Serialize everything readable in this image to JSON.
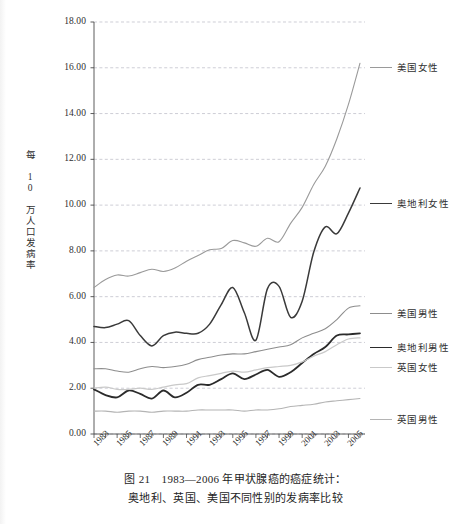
{
  "folio": "",
  "caption": {
    "line1": "图 21　1983—2006 年甲状腺癌的癌症统计：",
    "line2": "奥地利、英国、美国不同性别的发病率比较"
  },
  "axis": {
    "y_title": "每 10 万人口发病率"
  },
  "legend": [
    {
      "label": "美国女性",
      "color": "#9a9a9a",
      "width": 1.1,
      "y": 60
    },
    {
      "label": "奥地利女性",
      "color": "#3a3a3a",
      "width": 1.5,
      "y": 196
    },
    {
      "label": "美国男性",
      "color": "#8d8d8d",
      "width": 1.1,
      "y": 306
    },
    {
      "label": "奥地利男性",
      "color": "#2b2b2b",
      "width": 1.8,
      "y": 340
    },
    {
      "label": "英国女性",
      "color": "#c9c9c9",
      "width": 1.2,
      "y": 360
    },
    {
      "label": "英国男性",
      "color": "#b4b4b4",
      "width": 1.1,
      "y": 412
    }
  ],
  "chart_data": {
    "type": "line",
    "xlabel": "",
    "ylabel": "每 10 万人口发病率",
    "ylim": [
      0,
      18
    ],
    "yticks": [
      "0.00",
      "2.00",
      "4.00",
      "6.00",
      "8.00",
      "10.00",
      "12.00",
      "14.00",
      "16.00",
      "18.00"
    ],
    "ytick_values": [
      0,
      2,
      4,
      6,
      8,
      10,
      12,
      14,
      16,
      18
    ],
    "grid": true,
    "legend_position": "right",
    "x": [
      1983,
      1984,
      1985,
      1986,
      1987,
      1988,
      1989,
      1990,
      1991,
      1992,
      1993,
      1994,
      1995,
      1996,
      1997,
      1998,
      1999,
      2000,
      2001,
      2002,
      2003,
      2004,
      2005,
      2006
    ],
    "xtick_labels": [
      "1983",
      "1985",
      "1987",
      "1989",
      "1991",
      "1993",
      "1995",
      "1997",
      "1999",
      "2001",
      "2003",
      "2005"
    ],
    "xtick_values": [
      1983,
      1985,
      1987,
      1989,
      1991,
      1993,
      1995,
      1997,
      1999,
      2001,
      2003,
      2005
    ],
    "series": [
      {
        "name": "美国女性",
        "color": "#9a9a9a",
        "values": [
          6.4,
          6.75,
          6.95,
          6.9,
          7.05,
          7.2,
          7.1,
          7.25,
          7.55,
          7.8,
          8.05,
          8.1,
          8.45,
          8.35,
          8.2,
          8.55,
          8.4,
          9.2,
          9.9,
          10.9,
          11.7,
          12.9,
          14.4,
          16.2
        ]
      },
      {
        "name": "奥地利女性",
        "color": "#3a3a3a",
        "values": [
          4.7,
          4.65,
          4.8,
          4.95,
          4.3,
          3.85,
          4.3,
          4.45,
          4.4,
          4.4,
          4.8,
          5.65,
          6.4,
          5.3,
          4.1,
          6.35,
          6.45,
          5.1,
          5.8,
          7.95,
          9.05,
          8.75,
          9.65,
          10.75
        ]
      },
      {
        "name": "美国男性",
        "color": "#8d8d8d",
        "values": [
          2.85,
          2.85,
          2.75,
          2.7,
          2.85,
          2.95,
          2.9,
          2.95,
          3.05,
          3.25,
          3.35,
          3.45,
          3.5,
          3.5,
          3.6,
          3.7,
          3.8,
          3.9,
          4.2,
          4.4,
          4.6,
          5.0,
          5.5,
          5.6
        ]
      },
      {
        "name": "奥地利男性",
        "color": "#2b2b2b",
        "values": [
          1.95,
          1.7,
          1.6,
          1.9,
          1.75,
          1.55,
          1.9,
          1.6,
          1.8,
          2.15,
          2.15,
          2.4,
          2.65,
          2.4,
          2.6,
          2.8,
          2.5,
          2.7,
          3.1,
          3.5,
          3.8,
          4.3,
          4.35,
          4.4
        ]
      },
      {
        "name": "英国女性",
        "color": "#c9c9c9",
        "values": [
          2.0,
          2.05,
          1.95,
          1.95,
          2.0,
          1.95,
          2.05,
          2.15,
          2.2,
          2.45,
          2.55,
          2.65,
          2.75,
          2.7,
          2.8,
          2.9,
          2.95,
          3.0,
          3.15,
          3.4,
          3.6,
          3.9,
          4.15,
          4.2
        ]
      },
      {
        "name": "英国男性",
        "color": "#b4b4b4",
        "values": [
          1.0,
          1.0,
          0.95,
          1.0,
          1.0,
          0.95,
          1.0,
          1.0,
          1.0,
          1.05,
          1.05,
          1.05,
          1.05,
          1.0,
          1.05,
          1.05,
          1.1,
          1.2,
          1.25,
          1.3,
          1.4,
          1.45,
          1.5,
          1.55
        ]
      }
    ]
  }
}
